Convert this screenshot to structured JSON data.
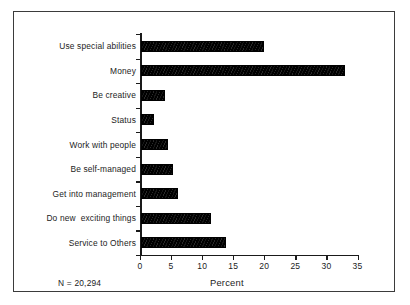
{
  "figure": {
    "note": "N = 20,294",
    "frame_color": "#3b3b3b",
    "bar_color": "#000000",
    "background": "#ffffff"
  },
  "chart_data": {
    "type": "bar",
    "orientation": "horizontal",
    "title": "",
    "subtitle": "",
    "xlabel": "Percent",
    "ylabel": "",
    "categories": [
      "Use special abilities",
      "Money",
      "Be creative",
      "Status",
      "Work with people",
      "Be self-managed",
      "Get into management",
      "Do new  exciting things",
      "Service to Others"
    ],
    "values": [
      19.8,
      32.9,
      3.9,
      2.1,
      4.3,
      5.2,
      6.0,
      11.2,
      13.7
    ],
    "xlim": [
      0,
      35
    ],
    "xticks": [
      0,
      5,
      10,
      15,
      20,
      25,
      30,
      35
    ],
    "xticklabels": [
      "0",
      "5",
      "10",
      "15",
      "20",
      "25",
      "30",
      "35"
    ],
    "grid": false,
    "legend": false,
    "annotations": [
      "N = 20,294"
    ]
  }
}
